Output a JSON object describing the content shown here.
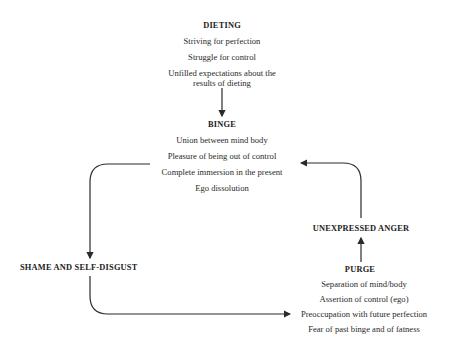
{
  "nodes": {
    "dieting": {
      "title": "DIETING",
      "items": [
        "Striving for perfection",
        "Struggle for control",
        "Unfilled expectations about the",
        "results of dieting"
      ]
    },
    "binge": {
      "title": "BINGE",
      "items": [
        "Union between mind body",
        "Pleasure of being out of control",
        "Complete immersion in the present",
        "Ego dissolution"
      ]
    },
    "shame": {
      "title": "SHAME AND SELF-DISGUST"
    },
    "anger": {
      "title": "UNEXPRESSED ANGER"
    },
    "purge": {
      "title": "PURGE",
      "items": [
        "Separation of mind/body",
        "Assertion of control (ego)",
        "Preoccupation with future perfection",
        "Fear of past binge and of fatness"
      ]
    }
  },
  "edges": [
    {
      "from": "dieting",
      "to": "binge"
    },
    {
      "from": "binge",
      "to": "shame"
    },
    {
      "from": "shame",
      "to": "purge"
    },
    {
      "from": "purge",
      "to": "anger"
    },
    {
      "from": "anger",
      "to": "binge"
    }
  ],
  "colors": {
    "line": "#2a2a2a",
    "background": "#ffffff"
  }
}
